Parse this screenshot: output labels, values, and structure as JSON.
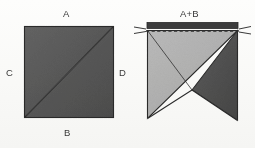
{
  "figure": {
    "title_hidden": "",
    "background_color": "#fdfdfc",
    "labels": {
      "a": "A",
      "b": "B",
      "c": "C",
      "d": "D",
      "a_plus_b": "A+B"
    },
    "colors": {
      "dark_fabric": "#5a5a5a",
      "dark_fabric_shade": "#4a4a4a",
      "light_fabric": "#b4b4b4",
      "outline": "#2b2b2b",
      "seam_strip": "#3c3c3c",
      "stitch_line": "#2e2e2e",
      "label_text": "#3a3a3a"
    },
    "left_unit": {
      "name": "single-square-piece",
      "description": "dark fabric square with corner-to-corner diagonal fold line",
      "edge_labels": [
        "A",
        "C",
        "D",
        "B"
      ],
      "diagonal": "bottom-left to top-right"
    },
    "right_unit": {
      "name": "joined-square-piece",
      "description": "light and dark fabric joined along a seam, stitched across the top edge",
      "top_label": "A+B",
      "seam_allowance": "top strip",
      "stitch_style": "dashed",
      "notch": "V-shaped opening at bottom center",
      "tick_marks": [
        "left-edge",
        "right-edge"
      ]
    }
  }
}
